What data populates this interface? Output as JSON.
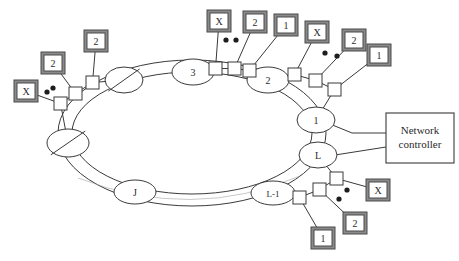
{
  "diagram": {
    "colors": {
      "line": "#3a3a3a",
      "box_fill": "#ffffff",
      "box_shadow": "#8a8a8a",
      "box_edge": "#4a4a4a",
      "text": "#2b2b2b"
    },
    "controller": {
      "label_line1": "Network",
      "label_line2": "controller"
    },
    "ring_nodes": [
      {
        "name": "node-3",
        "label": "3",
        "cx": 193,
        "cy": 72,
        "rx": 21,
        "ry": 13
      },
      {
        "name": "node-2",
        "label": "2",
        "cx": 268,
        "cy": 80,
        "rx": 21,
        "ry": 13
      },
      {
        "name": "node-1",
        "label": "1",
        "cx": 316,
        "cy": 120,
        "rx": 19,
        "ry": 13
      },
      {
        "name": "node-L",
        "label": "L",
        "cx": 318,
        "cy": 155,
        "rx": 19,
        "ry": 13
      },
      {
        "name": "node-L-1",
        "label": "L-1",
        "cx": 273,
        "cy": 193,
        "rx": 22,
        "ry": 12
      },
      {
        "name": "node-J",
        "label": "J",
        "cx": 135,
        "cy": 192,
        "rx": 21,
        "ry": 12
      }
    ],
    "slashed_nodes": [
      {
        "name": "slashed-node-top",
        "cx": 124,
        "cy": 80,
        "rx": 19,
        "ry": 13
      },
      {
        "name": "slashed-node-left",
        "cx": 68,
        "cy": 143,
        "rx": 21,
        "ry": 14
      }
    ],
    "terminals": [
      {
        "name": "terminal-x-left",
        "label": "X",
        "x": 14,
        "y": 80
      },
      {
        "name": "terminal-2-left",
        "label": "2",
        "x": 41,
        "y": 52
      },
      {
        "name": "terminal-2-upperleft",
        "label": "2",
        "x": 84,
        "y": 30
      },
      {
        "name": "terminal-x-top",
        "label": "X",
        "x": 207,
        "y": 10
      },
      {
        "name": "terminal-2-top",
        "label": "2",
        "x": 243,
        "y": 11
      },
      {
        "name": "terminal-1-top",
        "label": "1",
        "x": 274,
        "y": 14
      },
      {
        "name": "terminal-x-topright",
        "label": "X",
        "x": 305,
        "y": 21
      },
      {
        "name": "terminal-2-topright",
        "label": "2",
        "x": 342,
        "y": 29
      },
      {
        "name": "terminal-1-topright",
        "label": "1",
        "x": 367,
        "y": 44
      },
      {
        "name": "terminal-x-bottom",
        "label": "X",
        "x": 366,
        "y": 179
      },
      {
        "name": "terminal-2-bottom",
        "label": "2",
        "x": 343,
        "y": 212
      },
      {
        "name": "terminal-1-bottom",
        "label": "1",
        "x": 311,
        "y": 227
      }
    ],
    "taps": [
      {
        "name": "tap-left-a",
        "x": 54,
        "y": 97
      },
      {
        "name": "tap-left-b",
        "x": 69,
        "y": 87
      },
      {
        "name": "tap-left-c",
        "x": 86,
        "y": 76
      },
      {
        "name": "tap-top-a",
        "x": 209,
        "y": 62
      },
      {
        "name": "tap-top-b",
        "x": 228,
        "y": 62
      },
      {
        "name": "tap-top-c",
        "x": 243,
        "y": 64
      },
      {
        "name": "tap-right-a",
        "x": 288,
        "y": 68
      },
      {
        "name": "tap-right-b",
        "x": 309,
        "y": 74
      },
      {
        "name": "tap-right-c",
        "x": 328,
        "y": 83
      },
      {
        "name": "tap-bot-a",
        "x": 293,
        "y": 191
      },
      {
        "name": "tap-bot-b",
        "x": 313,
        "y": 183
      },
      {
        "name": "tap-bot-c",
        "x": 330,
        "y": 172
      }
    ],
    "ellipsis_groups": [
      {
        "name": "ellipsis-left",
        "dots": [
          [
            47,
            92
          ],
          [
            53,
            88
          ]
        ]
      },
      {
        "name": "ellipsis-top",
        "dots": [
          [
            226,
            40
          ],
          [
            236,
            40
          ]
        ]
      },
      {
        "name": "ellipsis-topright",
        "dots": [
          [
            325,
            53
          ],
          [
            337,
            56
          ]
        ]
      },
      {
        "name": "ellipsis-bottom",
        "dots": [
          [
            347,
            190
          ],
          [
            339,
            199
          ]
        ]
      }
    ]
  }
}
